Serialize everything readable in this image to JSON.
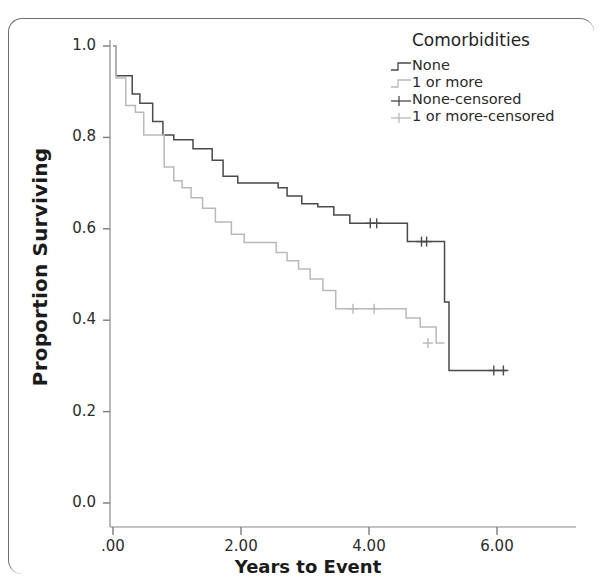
{
  "figure": {
    "background": "#ffffff",
    "border_color": "#6f6f6f"
  },
  "legend": {
    "title": "Comorbidities",
    "entries": [
      {
        "label": "None",
        "type": "step",
        "color": "#4a4a4a"
      },
      {
        "label": "1 or more",
        "type": "step",
        "color": "#b9b9b9"
      },
      {
        "label": "None-censored",
        "type": "censor",
        "color": "#4a4a4a"
      },
      {
        "label": "1 or more-censored",
        "type": "censor",
        "color": "#b9b9b9"
      }
    ]
  },
  "chart_data": {
    "type": "line",
    "title": "",
    "xlabel": "Years to Event",
    "ylabel": "Proportion Surviving",
    "xlim": [
      -0.18,
      6.6
    ],
    "ylim": [
      0.0,
      1.05
    ],
    "xticks": [
      0,
      2,
      4,
      6
    ],
    "xtick_labels": [
      ".00",
      "2.00",
      "4.00",
      "6.00"
    ],
    "yticks": [
      0.0,
      0.2,
      0.4,
      0.6,
      0.8,
      1.0
    ],
    "ytick_labels": [
      "0.0",
      "0.2",
      "0.4",
      "0.6",
      "0.8",
      "1.0"
    ],
    "grid": false,
    "legend_position": "top-right",
    "series": [
      {
        "name": "None",
        "color": "#4a4a4a",
        "step": "post",
        "x": [
          0.0,
          0.05,
          0.18,
          0.3,
          0.42,
          0.62,
          0.78,
          0.95,
          1.25,
          1.55,
          1.72,
          1.95,
          2.3,
          2.58,
          2.72,
          2.95,
          3.2,
          3.45,
          3.7,
          4.35,
          4.6,
          5.18,
          5.18,
          5.25,
          6.15
        ],
        "y": [
          1.0,
          0.935,
          0.935,
          0.895,
          0.875,
          0.835,
          0.805,
          0.795,
          0.775,
          0.75,
          0.715,
          0.7,
          0.7,
          0.69,
          0.672,
          0.655,
          0.648,
          0.63,
          0.612,
          0.612,
          0.572,
          0.572,
          0.44,
          0.29,
          0.29
        ],
        "censored_points": [
          {
            "x": 4.02,
            "y": 0.612
          },
          {
            "x": 4.12,
            "y": 0.612
          },
          {
            "x": 4.82,
            "y": 0.572
          },
          {
            "x": 4.9,
            "y": 0.572
          },
          {
            "x": 5.95,
            "y": 0.29
          },
          {
            "x": 6.1,
            "y": 0.29
          }
        ]
      },
      {
        "name": "1 or more",
        "color": "#b9b9b9",
        "step": "post",
        "x": [
          0.0,
          0.05,
          0.2,
          0.35,
          0.48,
          0.62,
          0.8,
          0.95,
          1.08,
          1.22,
          1.4,
          1.6,
          1.85,
          2.05,
          2.3,
          2.55,
          2.72,
          2.9,
          3.08,
          3.28,
          3.48,
          4.35,
          4.58,
          4.8,
          5.05,
          5.18
        ],
        "y": [
          1.0,
          0.93,
          0.87,
          0.855,
          0.805,
          0.805,
          0.735,
          0.705,
          0.69,
          0.668,
          0.645,
          0.615,
          0.588,
          0.57,
          0.57,
          0.548,
          0.53,
          0.512,
          0.49,
          0.465,
          0.425,
          0.425,
          0.405,
          0.385,
          0.35,
          0.35
        ],
        "censored_points": [
          {
            "x": 3.75,
            "y": 0.425
          },
          {
            "x": 4.08,
            "y": 0.425
          },
          {
            "x": 4.92,
            "y": 0.35
          }
        ]
      }
    ]
  }
}
